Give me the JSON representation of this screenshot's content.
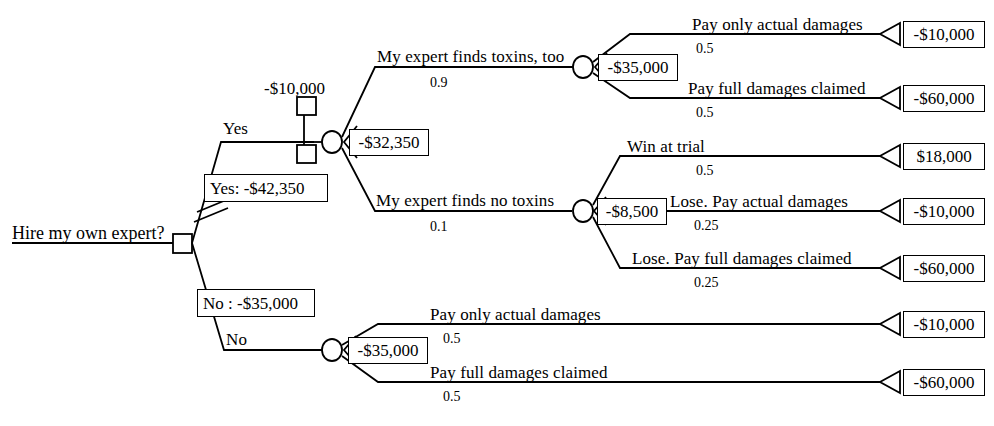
{
  "diagram": {
    "title_text": "Hire my own expert?",
    "type": "decision-tree",
    "root": {
      "label": "Hire my own expert?",
      "node_kind": "decision"
    },
    "branches": {
      "yes_label": "Yes",
      "no_label": "No",
      "yes_summary": "Yes: -$42,350",
      "no_summary": "No : -$35,000",
      "yes_pruned": true,
      "cost_marker_value": "-$10,000"
    },
    "expected_values": {
      "yes_chance_node": "-$32,350",
      "toxins_found_node": "-$35,000",
      "no_toxins_node": "-$8,500",
      "no_expert_node": "-$35,000"
    },
    "sub_branches": {
      "toxins_found": {
        "label": "My expert finds toxins, too",
        "prob": "0.9"
      },
      "no_toxins": {
        "label": "My expert finds no toxins",
        "prob": "0.1"
      }
    },
    "outcomes": [
      {
        "label": "Pay only actual damages",
        "prob": "0.5",
        "value": "-$10,000"
      },
      {
        "label": "Pay full damages claimed",
        "prob": "0.5",
        "value": "-$60,000"
      },
      {
        "label": "Win at trial",
        "prob": "0.5",
        "value": "$18,000"
      },
      {
        "label": "Lose. Pay actual damages",
        "prob": "0.25",
        "value": "-$10,000"
      },
      {
        "label": "Lose. Pay full damages claimed",
        "prob": "0.25",
        "value": "-$60,000"
      },
      {
        "label": "Pay only actual damages",
        "prob": "0.5",
        "value": "-$10,000"
      },
      {
        "label": "Pay full damages claimed",
        "prob": "0.5",
        "value": "-$60,000"
      }
    ],
    "colors": {
      "stroke": "#000000",
      "fill": "#ffffff",
      "text": "#000000"
    }
  }
}
